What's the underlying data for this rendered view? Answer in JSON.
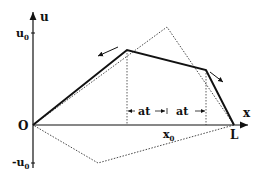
{
  "diagram": {
    "type": "string-displacement-profile",
    "axes": {
      "vertical_label": "u",
      "horizontal_label": "x",
      "origin_label": "O",
      "end_label": "L",
      "u0_label": "u",
      "u0_sub": "0",
      "neg_u0_label": "-u",
      "neg_u0_sub": "0"
    },
    "annotations": {
      "x0_label": "x",
      "x0_sub": "0",
      "at_left": "at",
      "at_right": "at"
    },
    "colors": {
      "line": "#111111",
      "dotted": "#333333"
    }
  }
}
